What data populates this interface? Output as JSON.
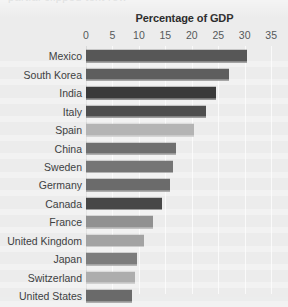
{
  "chart_data": {
    "type": "bar",
    "orientation": "horizontal",
    "title": "Percentage of GDP",
    "xlabel": "",
    "ylabel": "",
    "xlim": [
      0,
      35
    ],
    "grid": true,
    "legend": "none",
    "xticks": [
      0,
      5,
      10,
      15,
      20,
      25,
      30,
      35
    ],
    "xtick_labels": [
      "0",
      "5",
      "10",
      "15",
      "20",
      "25",
      "30",
      "35"
    ],
    "categories": [
      "Mexico",
      "South Korea",
      "India",
      "Italy",
      "Spain",
      "China",
      "Sweden",
      "Germany",
      "Canada",
      "France",
      "United Kingdom",
      "Japan",
      "Switzerland",
      "United States"
    ],
    "values": [
      30.5,
      27.0,
      24.5,
      22.7,
      20.4,
      17.0,
      16.4,
      15.9,
      14.4,
      12.7,
      11.0,
      9.6,
      9.3,
      8.7
    ],
    "bar_colors": [
      "#575757",
      "#5e5e5e",
      "#3a3a3a",
      "#4e4e4e",
      "#b4b4b4",
      "#6f6f6f",
      "#757575",
      "#6b6b6b",
      "#474747",
      "#919191",
      "#a3a3a3",
      "#7d7d7d",
      "#adadad",
      "#6a6a6a"
    ]
  },
  "style": {
    "background": "#ececec",
    "gridline_color": "#fafafa",
    "axis_color": "#d8d9d9",
    "tick_text_color": "#55595a",
    "label_text_color": "#3d4142",
    "title_color": "#2b2b2b"
  },
  "artifacts": {
    "top_cutoff_text": "partial clipped text row"
  }
}
